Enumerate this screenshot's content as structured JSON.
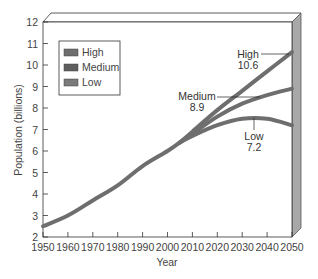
{
  "chart_data": {
    "type": "line",
    "title": "",
    "xlabel": "Year",
    "ylabel": "Population (billions)",
    "xlim": [
      1950,
      2050
    ],
    "ylim": [
      2,
      12
    ],
    "x_ticks": [
      "1950",
      "1960",
      "1970",
      "1980",
      "1990",
      "2000",
      "2010",
      "2020",
      "2030",
      "2040",
      "2050"
    ],
    "y_ticks": [
      "2",
      "3",
      "4",
      "5",
      "6",
      "7",
      "8",
      "9",
      "10",
      "11",
      "12"
    ],
    "historical": {
      "x": [
        1950,
        1960,
        1970,
        1980,
        1990,
        2000,
        2005
      ],
      "y": [
        2.5,
        3.0,
        3.7,
        4.4,
        5.3,
        6.0,
        6.4
      ]
    },
    "series": [
      {
        "name": "High",
        "x": [
          2005,
          2010,
          2020,
          2030,
          2040,
          2050
        ],
        "values": [
          6.4,
          6.9,
          7.9,
          8.8,
          9.7,
          10.6
        ],
        "end_label": "10.6"
      },
      {
        "name": "Medium",
        "x": [
          2005,
          2010,
          2020,
          2030,
          2040,
          2050
        ],
        "values": [
          6.4,
          6.8,
          7.6,
          8.2,
          8.6,
          8.9
        ],
        "end_label": "8.9"
      },
      {
        "name": "Low",
        "x": [
          2005,
          2010,
          2020,
          2030,
          2040,
          2050
        ],
        "values": [
          6.4,
          6.7,
          7.2,
          7.5,
          7.5,
          7.2
        ],
        "end_label": "7.2"
      }
    ],
    "legend": {
      "position": "upper-left",
      "entries": [
        "High",
        "Medium",
        "Low"
      ]
    },
    "grid": false
  },
  "colors": {
    "line": "#6e6e6e",
    "frame": "#333333",
    "side_panel": "#a8a8a8",
    "legend_swatch": "#6e6e6e"
  },
  "annotations": {
    "high_name": "High",
    "high_value": "10.6",
    "medium_name": "Medium",
    "medium_value": "8.9",
    "low_name": "Low",
    "low_value": "7.2"
  }
}
